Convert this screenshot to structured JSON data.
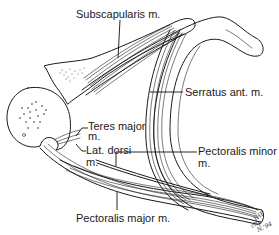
{
  "diagram": {
    "labels": {
      "subscapularis": "Subscapularis m.",
      "serratus": "Serratus ant. m.",
      "teres_major": "Teres major",
      "teres_major_m": "m.",
      "lat_dorsi": "Lat. dorsi",
      "lat_dorsi_m": "m.",
      "pectoralis_minor": "Pectoralis minor",
      "pectoralis_minor_m": "m.",
      "pectoralis_major": "Pectoralis major m."
    },
    "signature": {
      "initials": "JHP",
      "line2": "chp",
      "line3": "N.'94"
    }
  }
}
